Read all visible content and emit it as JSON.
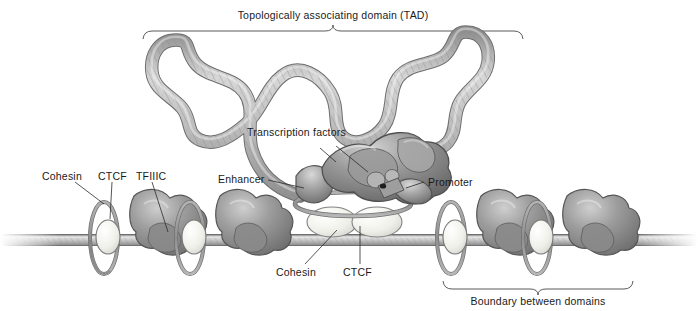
{
  "figure": {
    "background_color": "#ffffff",
    "width": 698,
    "height": 311
  },
  "annotations": {
    "tad_title": "Topologically associating domain (TAD)",
    "boundary_title": "Boundary between domains",
    "cohesin_left": "Cohesin",
    "ctcf_left": "CTCF",
    "tfiiic_left": "TFIIIC",
    "transcription_factors": "Transcription factors",
    "enhancer": "Enhancer",
    "promoter": "Promoter",
    "cohesin_center": "Cohesin",
    "ctcf_center": "CTCF"
  },
  "palette": {
    "chromatin_fiber": "#b9b9b9",
    "chromatin_outline": "#6e6e6e",
    "protein_blob": "#8e8e8e",
    "protein_blob_dark": "#6a6a6a",
    "protein_blob_light": "#c2c2c2",
    "ctcf_oval": "#f2f2ee",
    "ctcf_outline": "#777777",
    "cohesin_ring": "#9a9a9a",
    "dna_strand": "#b0b0b0",
    "label_text": "#1a1a1a",
    "leader_line": "#2b2b2b",
    "brace_line": "#5a5a5a"
  },
  "structures": {
    "dna_axis_y": 240,
    "boundary_units_left": [
      {
        "name": "boundary-unit-left-1",
        "x": 110
      },
      {
        "name": "boundary-unit-left-2",
        "x": 196
      }
    ],
    "boundary_units_right": [
      {
        "name": "boundary-unit-right-1",
        "x": 470
      },
      {
        "name": "boundary-unit-right-2",
        "x": 556
      }
    ],
    "tad_bracket": {
      "x_start": 143,
      "x_end": 523,
      "y": 30
    },
    "boundary_bracket": {
      "x_start": 443,
      "x_end": 633,
      "y": 288
    },
    "central_complex": {
      "x": 348,
      "y": 175
    }
  }
}
